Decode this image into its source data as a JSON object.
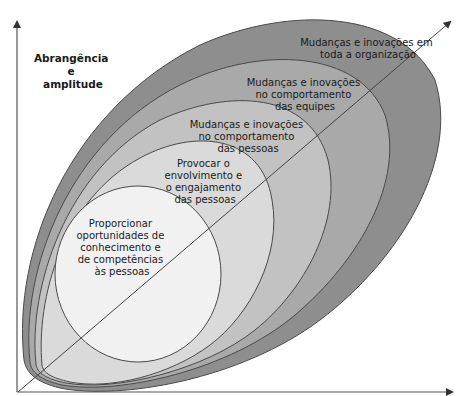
{
  "diagram": {
    "type": "nested-layers",
    "y_axis_label": [
      "Abrangência",
      "e",
      "amplitude"
    ],
    "layers": [
      {
        "id": "organizacao",
        "level": 5,
        "label": [
          "Mudanças e inovações em",
          "toda a organização"
        ],
        "fill": "#8e8e8e"
      },
      {
        "id": "equipes",
        "level": 4,
        "label": [
          "Mudanças e inovações",
          "no comportamento",
          "das equipes"
        ],
        "fill": "#a9a9a9"
      },
      {
        "id": "pessoas-comportamento",
        "level": 3,
        "label": [
          "Mudanças e inovações",
          "no comportamento",
          "das pessoas"
        ],
        "fill": "#c2c2c2"
      },
      {
        "id": "engajamento",
        "level": 2,
        "label": [
          "Provocar o",
          "envolvimento e",
          "o engajamento",
          "das pessoas"
        ],
        "fill": "#dadada"
      },
      {
        "id": "competencias",
        "level": 1,
        "label": [
          "Proporcionar",
          "oportunidades de",
          "conhecimento e",
          "de competências",
          "às pessoas"
        ],
        "fill": "#f1f1f1"
      }
    ],
    "colors": {
      "stroke": "#4a4a4a",
      "axis": "#555555",
      "text": "#1a1a1a"
    }
  }
}
